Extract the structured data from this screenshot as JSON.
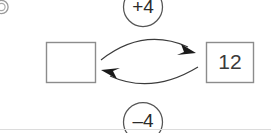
{
  "diagram": {
    "type": "function-machine-inverse-operations",
    "left_box": {
      "value": "",
      "is_blank": true
    },
    "right_box": {
      "value": "12",
      "is_blank": false
    },
    "top_operation": {
      "label": "+4",
      "direction": "left-to-right"
    },
    "bottom_operation": {
      "label": "–4",
      "direction": "right-to-left"
    },
    "corner_marker": {
      "label": "⑨",
      "cut_off": true
    }
  },
  "colors": {
    "background": "#ffffff",
    "box_border": "#8c8c8c",
    "box_text": "#3a3a3a",
    "circle_border": "#555555",
    "circle_text": "#2b2b2b",
    "arrow": "#3b3b3b",
    "arrow_head": "#1a1a1a",
    "divider": "#dcdcdc"
  }
}
